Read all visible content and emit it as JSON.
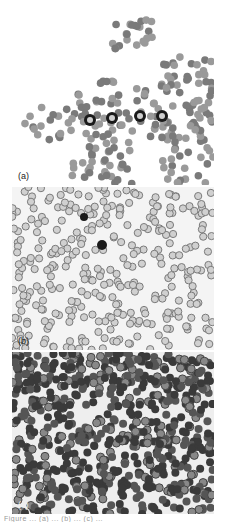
{
  "figure": {
    "panels": [
      {
        "id": "a",
        "label": "(a)",
        "description": "Blood smear, thick clumped area with dark-stained leukocytes in center"
      },
      {
        "id": "b",
        "label": "(b)",
        "description": "Blood smear, evenly spread red cells with scattered dark cell"
      },
      {
        "id": "c",
        "label": "(c)",
        "description": "Blood smear, dense dark-stained red cells"
      }
    ],
    "caption": "Figure ... (a) ... (b) ... (c) ..."
  },
  "colors": {
    "cell_light": "#9a9a9a",
    "cell_mid": "#7a7a7a",
    "cell_dark": "#3a3a3a",
    "nucleus": "#1a1a1a",
    "background": "#ffffff"
  }
}
